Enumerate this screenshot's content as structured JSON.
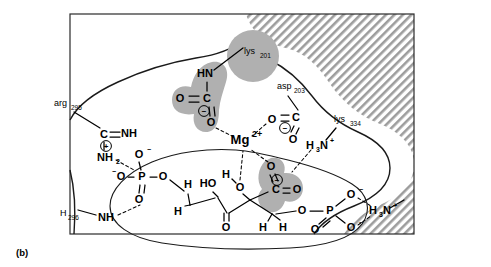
{
  "figure": {
    "panel_label": "(b)",
    "caption_text": "(b)",
    "type": "enzyme-active-site",
    "colors": {
      "hatch_stroke": "#9a9a9a",
      "hatch_bg": "#ffffff",
      "halo_gray": "#b0b0b0",
      "line_black": "#000000",
      "outline": "#1a1a1a",
      "page_bg": "#ffffff"
    }
  },
  "residues": [
    {
      "id": "arg295",
      "name": "arg",
      "number": "295",
      "x": 57,
      "y": 104
    },
    {
      "id": "lys201",
      "name": "lys",
      "number": "201",
      "x": 248,
      "y": 52
    },
    {
      "id": "asp203",
      "name": "asp",
      "number": "203",
      "x": 280,
      "y": 87
    },
    {
      "id": "lys334",
      "name": "lys",
      "number": "334",
      "x": 337,
      "y": 120
    },
    {
      "id": "his296",
      "name": "H",
      "number": "296",
      "x": 63,
      "y": 216
    }
  ],
  "metal": {
    "label": "Mg",
    "charge": "2+",
    "x": 244,
    "y": 141
  },
  "atoms": [
    {
      "id": "hn-upper",
      "text": "HN",
      "x": 205,
      "y": 74
    },
    {
      "id": "c-upper",
      "text": "C",
      "x": 207,
      "y": 99
    },
    {
      "id": "o-upper-left",
      "text": "O",
      "x": 180,
      "y": 99
    },
    {
      "id": "o-upper-low",
      "text": "O",
      "x": 211,
      "y": 123
    },
    {
      "id": "o-asp-left",
      "text": "O",
      "x": 272,
      "y": 120
    },
    {
      "id": "c-asp",
      "text": "C",
      "x": 296,
      "y": 118
    },
    {
      "id": "o-asp-low",
      "text": "O",
      "x": 291,
      "y": 138
    },
    {
      "id": "h3n-lys334",
      "text": "H",
      "x": 321,
      "y": 146
    },
    {
      "id": "c-arg",
      "text": "C",
      "x": 104,
      "y": 135
    },
    {
      "id": "nh-arg",
      "text": "NH",
      "x": 127,
      "y": 134
    },
    {
      "id": "nh2-arg",
      "text": "NH",
      "x": 105,
      "y": 157
    },
    {
      "id": "o-p1-top",
      "text": "O",
      "x": 139,
      "y": 155
    },
    {
      "id": "o-p1-left",
      "text": "O",
      "x": 120,
      "y": 177
    },
    {
      "id": "p1",
      "text": "P",
      "x": 142,
      "y": 177
    },
    {
      "id": "o-p1-right",
      "text": "O",
      "x": 163,
      "y": 177
    },
    {
      "id": "o-p1-bot",
      "text": "O",
      "x": 139,
      "y": 200
    },
    {
      "id": "nh-his",
      "text": "NH",
      "x": 105,
      "y": 218
    },
    {
      "id": "h-c3-up",
      "text": "H",
      "x": 188,
      "y": 185
    },
    {
      "id": "h-c3-down",
      "text": "H",
      "x": 178,
      "y": 212
    },
    {
      "id": "ho-c",
      "text": "HO",
      "x": 207,
      "y": 184
    },
    {
      "id": "o-ketone",
      "text": "O",
      "x": 226,
      "y": 228
    },
    {
      "id": "h-water",
      "text": "H",
      "x": 226,
      "y": 175
    },
    {
      "id": "o-water",
      "text": "O",
      "x": 240,
      "y": 187
    },
    {
      "id": "o-sub-top",
      "text": "O",
      "x": 271,
      "y": 167
    },
    {
      "id": "c-sub-carb",
      "text": "C",
      "x": 276,
      "y": 190
    },
    {
      "id": "o-sub-right",
      "text": "O",
      "x": 297,
      "y": 190
    },
    {
      "id": "h-c1-left",
      "text": "H",
      "x": 263,
      "y": 226
    },
    {
      "id": "h-c1-right",
      "text": "H",
      "x": 283,
      "y": 226
    },
    {
      "id": "o-p2-left",
      "text": "O",
      "x": 303,
      "y": 211
    },
    {
      "id": "p2",
      "text": "P",
      "x": 330,
      "y": 211
    },
    {
      "id": "o-p2-up",
      "text": "O",
      "x": 351,
      "y": 195
    },
    {
      "id": "o-p2-down",
      "text": "O",
      "x": 351,
      "y": 228
    },
    {
      "id": "o-p2-dbl",
      "text": "O",
      "x": 315,
      "y": 229
    },
    {
      "id": "h3n-right",
      "text": "H",
      "x": 378,
      "y": 211
    }
  ],
  "molecular_groups": [
    {
      "id": "lys201-carbamate",
      "label": "carbamate on lys201",
      "highlighted": true
    },
    {
      "id": "asp203-carboxylate",
      "label": "aspartate carboxylate",
      "highlighted": false
    },
    {
      "id": "substrate-carboxylate",
      "label": "substrate carboxylate",
      "highlighted": true
    }
  ],
  "text_fragments": {
    "h3n_base": "H",
    "h3n_sub": "3",
    "h3n_n": "N",
    "h3n_plus": "+",
    "nh2_sub": "2",
    "minus_sign": "−",
    "plus_sign": "+"
  },
  "interactions": [
    {
      "from": "lys201-carbamate-O",
      "to": "Mg",
      "type": "coordination"
    },
    {
      "from": "asp203-O",
      "to": "Mg",
      "type": "coordination"
    },
    {
      "from": "water-O",
      "to": "Mg",
      "type": "coordination"
    },
    {
      "from": "substrate-carboxylate-O",
      "to": "Mg",
      "type": "coordination"
    },
    {
      "from": "lys334-H3N+",
      "to": "substrate-carboxylate",
      "type": "hydrogen-bond"
    },
    {
      "from": "arg295-guanidinium",
      "to": "phosphate-1",
      "type": "hydrogen-bond"
    },
    {
      "from": "his296-NH",
      "to": "phosphate-1",
      "type": "hydrogen-bond"
    },
    {
      "from": "H3N+-right",
      "to": "phosphate-2",
      "type": "hydrogen-bond"
    },
    {
      "from": "water-H",
      "to": "substrate",
      "type": "hydrogen-bond"
    }
  ]
}
